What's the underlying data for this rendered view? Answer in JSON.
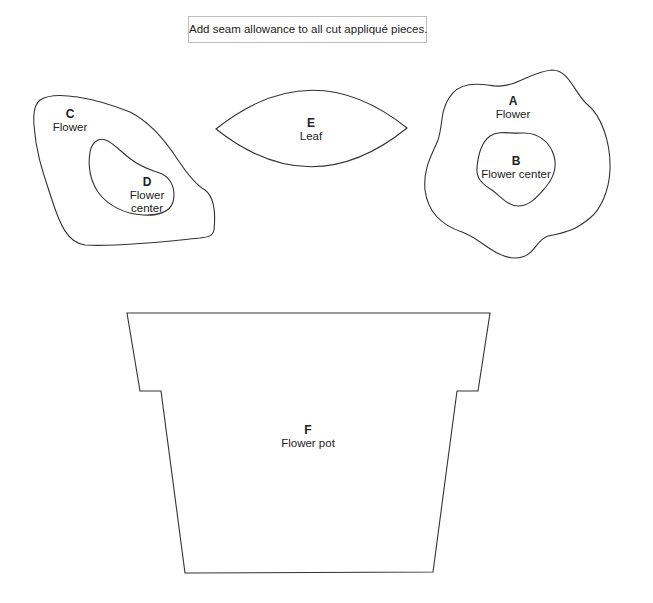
{
  "note": {
    "text": "Add seam allowance to all cut appliqué pieces."
  },
  "pieces": [
    {
      "id": "C",
      "name": "Flower"
    },
    {
      "id": "D",
      "name": "Flower",
      "name2": "center"
    },
    {
      "id": "E",
      "name": "Leaf"
    },
    {
      "id": "A",
      "name": "Flower"
    },
    {
      "id": "B",
      "name": "Flower center"
    },
    {
      "id": "F",
      "name": "Flower pot"
    }
  ],
  "colors": {
    "outline": "#333333",
    "background": "#ffffff",
    "note_border": "#bdbdbd"
  }
}
